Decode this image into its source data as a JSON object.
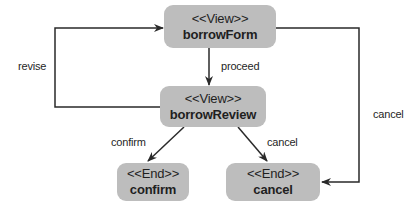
{
  "nodes": {
    "borrowForm": {
      "stereotype": "<<View>>",
      "name": "borrowForm"
    },
    "borrowReview": {
      "stereotype": "<<View>>",
      "name": "borrowReview"
    },
    "confirm": {
      "stereotype": "<<End>>",
      "name": "confirm"
    },
    "cancel": {
      "stereotype": "<<End>>",
      "name": "cancel"
    }
  },
  "edges": {
    "proceed": "proceed",
    "revise": "revise",
    "confirm": "confirm",
    "cancel_review": "cancel",
    "cancel_form": "cancel"
  },
  "colors": {
    "node_fill": "#bdbdbd",
    "line": "#2a2a2a",
    "text": "#1f1f1f"
  }
}
